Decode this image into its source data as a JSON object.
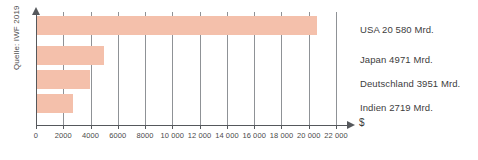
{
  "chart_data": {
    "type": "bar",
    "orientation": "horizontal",
    "title": "",
    "xlabel": "$",
    "ylabel": "",
    "categories": [
      "USA",
      "Japan",
      "Deutschland",
      "Indien"
    ],
    "values": [
      20580,
      4971,
      3951,
      2719
    ],
    "value_unit": "Mrd.",
    "labels": [
      "USA 20 580 Mrd.",
      "Japan 4971 Mrd.",
      "Deutschland 3951 Mrd.",
      "Indien 2719 Mrd."
    ],
    "xlim": [
      0,
      22000
    ],
    "xticks": [
      0,
      2000,
      4000,
      6000,
      8000,
      10000,
      12000,
      14000,
      16000,
      18000,
      20000,
      22000
    ],
    "xticklabels": [
      "0",
      "2000",
      "4000",
      "6000",
      "8000",
      "10 000",
      "12 000",
      "14 000",
      "16 000",
      "18 000",
      "20 000",
      "22 000"
    ],
    "grid": true,
    "grid_axis": "x",
    "legend": false,
    "bar_color": "#f4c0ab",
    "axis_color": "#55585c",
    "grid_color": "#8f9296"
  },
  "source": {
    "note": "Quelle: IWF 2019"
  },
  "axis": {
    "unit_symbol": "$"
  }
}
